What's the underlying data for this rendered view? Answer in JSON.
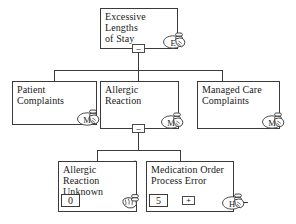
{
  "diagram": {
    "type": "hierarchical-tree",
    "background_color": "#ffffff",
    "line_color": "#3a3a3a",
    "text_color": "#1a1a1a"
  },
  "nodes": {
    "root": {
      "id": "excessive-lengths-of-stay",
      "label": "Excessive Lengths\nof Stay",
      "toggle": "–",
      "badge_letter": "E",
      "badge_icon": "hand-pointer-icon"
    },
    "level2": [
      {
        "id": "patient-complaints",
        "label": "Patient Complaints",
        "badge_letter": "M",
        "badge_icon": "hand-pointer-icon"
      },
      {
        "id": "allergic-reaction",
        "label": "Allergic Reaction",
        "toggle": "–",
        "badge_letter": "M",
        "badge_icon": "hand-pointer-icon"
      },
      {
        "id": "managed-care-complaints",
        "label": "Managed Care\nComplaints",
        "badge_letter": "M",
        "badge_icon": "hand-pointer-icon"
      }
    ],
    "level3": [
      {
        "id": "allergic-reaction-unknown",
        "label": "Allergic Reaction\nUnknown",
        "value": "0",
        "struck_through": true,
        "badge_letter": "",
        "badge_icon": "hand-fist-icon"
      },
      {
        "id": "medication-order-process-error",
        "label": "Medication Order\nProcess Error",
        "value": "5",
        "expand_toggle": "+",
        "badge_letter": "H",
        "badge_icon": "hand-pointer-icon"
      }
    ]
  }
}
